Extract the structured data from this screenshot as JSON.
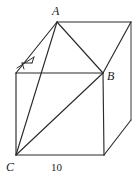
{
  "figure": {
    "name": "cube-diagram",
    "background_color": "#ffffff",
    "stroke_color": "#2b2b2b",
    "labels": {
      "vertex_a": "A",
      "vertex_b": "B",
      "vertex_c": "C",
      "edge_length": "10"
    },
    "vertices": {
      "A": [
        57,
        22
      ],
      "top_back_right": [
        131,
        22
      ],
      "top_front_left": [
        16,
        73
      ],
      "B": [
        103,
        73
      ],
      "bottom_front_left": [
        16,
        155
      ],
      "bottom_front_right": [
        104,
        155
      ],
      "bottom_back_right": [
        131,
        120
      ]
    },
    "edges": [
      {
        "name": "top-back-edge",
        "from": "A",
        "to": "top_back_right"
      },
      {
        "name": "top-left-edge",
        "from": "A",
        "to": "top_front_left"
      },
      {
        "name": "top-front-edge",
        "from": "top_front_left",
        "to": "B"
      },
      {
        "name": "top-right-edge",
        "from": "B",
        "to": "top_back_right"
      },
      {
        "name": "front-left-vertical",
        "from": "top_front_left",
        "to": "bottom_front_left"
      },
      {
        "name": "front-right-vertical",
        "from": "B",
        "to": "bottom_front_right"
      },
      {
        "name": "front-bottom-edge",
        "from": "bottom_front_left",
        "to": "bottom_front_right"
      },
      {
        "name": "back-right-vertical",
        "from": "top_back_right",
        "to": "bottom_back_right"
      },
      {
        "name": "bottom-right-edge",
        "from": "bottom_front_right",
        "to": "bottom_back_right"
      },
      {
        "name": "diagonal-A-to-B",
        "from": "A",
        "to": "B"
      },
      {
        "name": "diagonal-A-to-C",
        "from": "A",
        "to": "bottom_front_left"
      },
      {
        "name": "diagonal-C-to-B",
        "from": "bottom_front_left",
        "to": "B"
      }
    ],
    "right_angle_marker": {
      "name": "right-angle-marker",
      "location": [
        20,
        58
      ]
    },
    "edge_label_position": {
      "name": "edge-length-label",
      "edge": "front-bottom-edge"
    }
  }
}
